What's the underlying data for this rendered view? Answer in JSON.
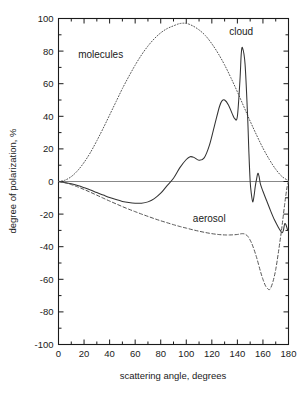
{
  "chart_data": {
    "type": "line",
    "title": "",
    "xlabel": "scattering angle, degrees",
    "ylabel": "degree of polarization, %",
    "xlim": [
      0,
      180
    ],
    "ylim": [
      -100,
      100
    ],
    "xticks": [
      0,
      20,
      40,
      60,
      80,
      100,
      120,
      140,
      160,
      180
    ],
    "xtick_labels": [
      "0",
      "20",
      "40",
      "60",
      "80",
      "100",
      "120",
      "140",
      "160",
      "180"
    ],
    "x_minor_step": 10,
    "yticks": [
      -100,
      -80,
      -60,
      -40,
      -20,
      0,
      20,
      40,
      60,
      80,
      100
    ],
    "ytick_labels": [
      "-100",
      "-80",
      "-60",
      "-40",
      "-20",
      "0",
      "20",
      "40",
      "60",
      "80",
      "100"
    ],
    "y_minor_step": 10,
    "grid": false,
    "legend_position": "inline-annotations",
    "zero_line": 0,
    "zero_line_color": "#888888",
    "series": [
      {
        "name": "molecules",
        "style": "dotted",
        "color": "#555555",
        "label_x": 33,
        "label_y": 78,
        "x": [
          0,
          5,
          10,
          15,
          20,
          25,
          30,
          35,
          40,
          45,
          50,
          55,
          60,
          65,
          70,
          75,
          80,
          85,
          90,
          95,
          100,
          105,
          110,
          115,
          120,
          125,
          130,
          135,
          140,
          145,
          150,
          155,
          160,
          165,
          170,
          175,
          180
        ],
        "values": [
          0,
          0.8,
          3.0,
          6.7,
          11.7,
          17.8,
          25.0,
          32.7,
          40.8,
          48.9,
          57.0,
          64.4,
          71.4,
          77.7,
          83.1,
          87.6,
          91.2,
          93.8,
          95.5,
          96.9,
          97.0,
          95.5,
          93.0,
          89.5,
          84.5,
          78.5,
          71.5,
          63.5,
          55.0,
          46.0,
          37.0,
          28.5,
          20.5,
          13.5,
          7.5,
          3.0,
          0.5
        ]
      },
      {
        "name": "cloud",
        "style": "solid",
        "color": "#333333",
        "label_x": 143,
        "label_y": 92,
        "x": [
          0,
          5,
          10,
          15,
          20,
          25,
          30,
          35,
          40,
          45,
          50,
          55,
          60,
          65,
          70,
          75,
          80,
          85,
          90,
          95,
          100,
          103,
          106,
          110,
          114,
          118,
          122,
          126,
          128,
          130,
          133,
          136,
          138,
          140,
          142,
          143,
          144,
          146,
          148,
          149,
          150,
          151,
          152,
          153,
          154,
          155,
          156,
          157,
          158,
          160,
          163,
          166,
          169,
          172,
          174,
          175,
          176,
          177,
          178,
          179,
          180
        ],
        "values": [
          0,
          -0.6,
          -1.4,
          -2.5,
          -3.8,
          -5.2,
          -6.8,
          -8.3,
          -9.8,
          -11.1,
          -12.2,
          -12.9,
          -13.3,
          -13.3,
          -12.5,
          -10.5,
          -7.2,
          -2.5,
          2.0,
          8.5,
          13.5,
          15.2,
          14.8,
          13.0,
          14.5,
          22.0,
          34.0,
          46.0,
          49.5,
          50.0,
          47.0,
          41.5,
          38.5,
          40.0,
          62.0,
          78.0,
          82.0,
          72.0,
          40.0,
          18.0,
          0.0,
          -8.0,
          -12.5,
          -9.0,
          -3.0,
          1.5,
          5.0,
          3.0,
          -1.5,
          -6.0,
          -12.0,
          -18.0,
          -23.5,
          -28.0,
          -30.5,
          -31.5,
          -30.0,
          -26.0,
          -26.5,
          -29.0,
          -30.5
        ]
      },
      {
        "name": "aerosol",
        "style": "dashed",
        "color": "#555555",
        "label_x": 118,
        "label_y": -23,
        "x": [
          0,
          5,
          10,
          15,
          20,
          25,
          30,
          35,
          40,
          45,
          50,
          55,
          60,
          65,
          70,
          75,
          80,
          85,
          90,
          95,
          100,
          105,
          110,
          115,
          120,
          125,
          128,
          131,
          134,
          137,
          140,
          142,
          144,
          146,
          148,
          150,
          152,
          155,
          158,
          160,
          162,
          164,
          165,
          166,
          168,
          170,
          172,
          174,
          175,
          176,
          177,
          178,
          179,
          180
        ],
        "values": [
          0,
          -0.8,
          -1.9,
          -3.3,
          -4.9,
          -6.6,
          -8.4,
          -10.2,
          -12.0,
          -13.7,
          -15.4,
          -17.0,
          -18.5,
          -20.0,
          -21.4,
          -22.8,
          -24.1,
          -25.3,
          -26.5,
          -27.6,
          -28.6,
          -29.6,
          -30.5,
          -31.3,
          -32.0,
          -32.5,
          -32.7,
          -32.8,
          -32.8,
          -32.7,
          -32.5,
          -32.2,
          -32.0,
          -32.3,
          -33.5,
          -36.0,
          -39.5,
          -46.5,
          -55.0,
          -60.0,
          -64.0,
          -66.0,
          -66.3,
          -65.5,
          -61.0,
          -54.0,
          -44.0,
          -33.0,
          -27.0,
          -20.5,
          -14.0,
          -8.0,
          -3.0,
          0.0
        ]
      }
    ]
  },
  "axes": {
    "x_title": "scattering angle, degrees",
    "y_title": "degree of polarization, %"
  }
}
